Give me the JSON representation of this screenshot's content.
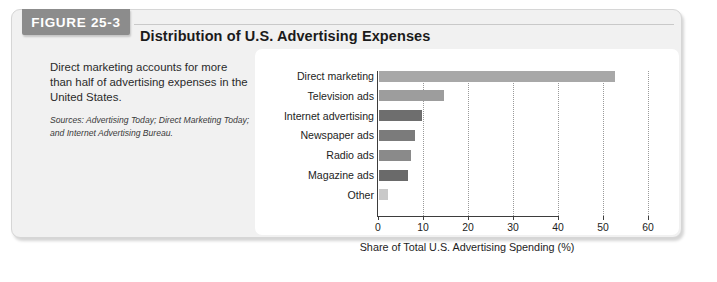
{
  "figure": {
    "tab_label": "FIGURE 25-3",
    "title": "Distribution of U.S. Advertising Expenses",
    "caption": "Direct marketing accounts for more than half of advertising expenses in the United States.",
    "sources": "Sources: Advertising Today; Direct Marketing Today; and Internet Advertising Bureau."
  },
  "colors": {
    "panel_background": "#f1f1f1",
    "panel_border": "#d6d6d6",
    "tab_background": "#8c8c8c",
    "tab_text": "#ffffff",
    "chart_background": "#ffffff",
    "axis": "#3d3d3d",
    "gridline": "#9a9a9a",
    "text": "#1d1d1d"
  },
  "chart_data": {
    "type": "bar",
    "orientation": "horizontal",
    "title": "Distribution of U.S. Advertising Expenses",
    "xlabel": "Share of Total U.S. Advertising Spending (%)",
    "ylabel": "",
    "xlim": [
      0,
      64
    ],
    "xticks": [
      0,
      10,
      20,
      30,
      40,
      50,
      60
    ],
    "xtick_labels": [
      "0",
      "10",
      "20",
      "30",
      "40",
      "50",
      "60"
    ],
    "grid": "vertical-dotted",
    "legend": "none",
    "categories": [
      "Direct marketing",
      "Television ads",
      "Internet advertising",
      "Newspaper ads",
      "Radio ads",
      "Magazine ads",
      "Other"
    ],
    "values": [
      52.5,
      14.5,
      9.5,
      8.0,
      7.0,
      6.5,
      2.0
    ],
    "bar_colors": [
      "#a8a8a8",
      "#9d9d9d",
      "#6e6e6e",
      "#7b7b7b",
      "#8a8a8a",
      "#6a6a6a",
      "#c9c9c9"
    ]
  }
}
